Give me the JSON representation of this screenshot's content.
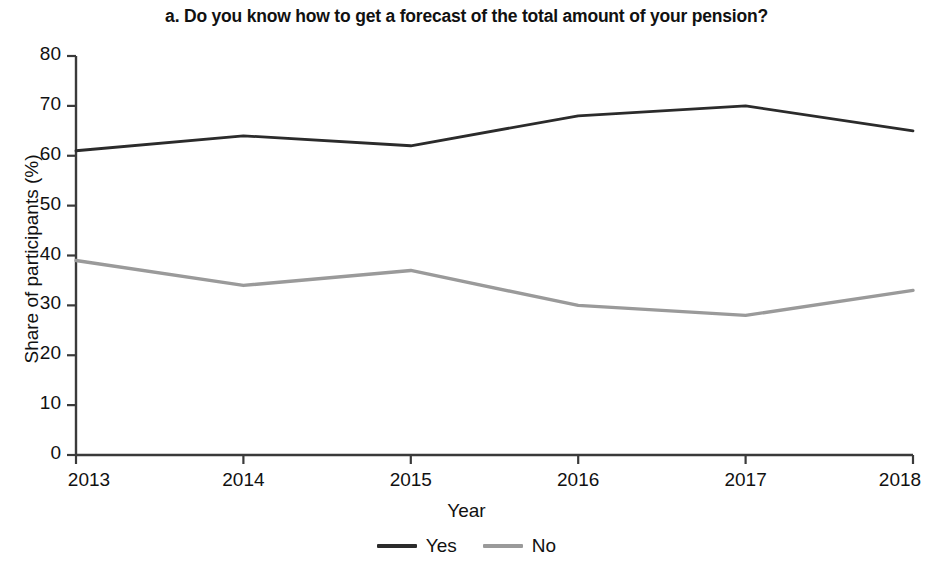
{
  "chart_data": {
    "type": "line",
    "title": "a. Do you know how to get a forecast of the total amount of your pension?",
    "subtitle": "",
    "xlabel": "Year",
    "ylabel": "Share of participants (%)",
    "categories": [
      "2013",
      "2014",
      "2015",
      "2016",
      "2017",
      "2018"
    ],
    "x": [
      2013,
      2014,
      2015,
      2016,
      2017,
      2018
    ],
    "series": [
      {
        "name": "Yes",
        "values": [
          61,
          64,
          62,
          68,
          70,
          65
        ],
        "color": "#2b2b2b"
      },
      {
        "name": "No",
        "values": [
          39,
          34,
          37,
          30,
          28,
          33
        ],
        "color": "#9a9a9a"
      }
    ],
    "ylim": [
      0,
      80
    ],
    "xlim": [
      2013,
      2018
    ],
    "yticks": [
      0,
      10,
      20,
      30,
      40,
      50,
      60,
      70,
      80
    ],
    "ytick_labels": [
      "0",
      "10",
      "20",
      "30",
      "40",
      "50",
      "60",
      "70",
      "80"
    ],
    "xtick_labels": [
      "2013",
      "2014",
      "2015",
      "2016",
      "2017",
      "2018"
    ],
    "grid": false,
    "legend_position": "bottom",
    "legend_entries": [
      "Yes",
      "No"
    ]
  },
  "legend": {
    "items": [
      {
        "label": "Yes",
        "color": "#2b2b2b"
      },
      {
        "label": "No",
        "color": "#9a9a9a"
      }
    ]
  },
  "axis": {
    "axis_color": "#3a3a3a"
  }
}
